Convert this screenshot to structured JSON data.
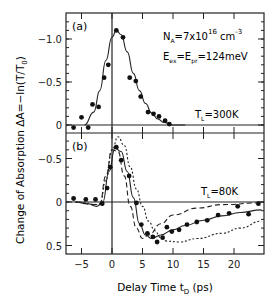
{
  "chart_data": [
    {
      "type": "scatter",
      "panel": "(a)",
      "title": "",
      "annotations": [
        "N_A=7x10^16 cm^-3",
        "E_ex=E_pr=124meV",
        "T_L=300K"
      ],
      "xlabel": "Delay Time t_D (ps)",
      "ylabel": "Change of Absorption ΔA=−ln(T/T_0)",
      "xlim": [
        -8,
        25
      ],
      "ylim": [
        0.1,
        -1.3
      ],
      "yticks": [
        -1.0,
        -0.5,
        0
      ],
      "series": [
        {
          "name": "data",
          "style": "filled-circles",
          "x": [
            -6.3,
            -5.0,
            -3.9,
            -3.2,
            -2.2,
            -1.3,
            -0.6,
            0.7,
            1.8,
            2.9,
            3.9,
            4.7,
            5.9,
            6.8,
            7.7,
            8.7,
            9.4
          ],
          "y": [
            0.03,
            -0.09,
            0.03,
            -0.24,
            -0.21,
            -0.55,
            -0.7,
            -1.1,
            -1.02,
            -0.55,
            -0.51,
            -0.33,
            -0.15,
            -0.13,
            -0.1,
            -0.05,
            -0.01
          ]
        },
        {
          "name": "fit",
          "style": "solid-line",
          "x": [
            -4.5,
            -3,
            -2,
            -1,
            0,
            0.7,
            1.5,
            2.5,
            3.5,
            4.5,
            5.5,
            6.5,
            7.5,
            8.5,
            10,
            12
          ],
          "y": [
            0,
            -0.15,
            -0.4,
            -0.75,
            -1.02,
            -1.1,
            -1.05,
            -0.85,
            -0.6,
            -0.4,
            -0.25,
            -0.14,
            -0.07,
            -0.03,
            0,
            0
          ]
        }
      ]
    },
    {
      "type": "scatter",
      "panel": "(b)",
      "title": "",
      "annotations": [
        "T_L=80K"
      ],
      "xlabel": "Delay Time t_D (ps)",
      "ylabel": "Change of Absorption ΔA=−ln(T/T_0)",
      "xlim": [
        -8,
        25
      ],
      "ylim": [
        -0.85,
        0.55
      ],
      "xticks": [
        -5,
        0,
        5,
        10,
        15,
        20
      ],
      "yticks": [
        -0.5,
        0,
        0.5
      ],
      "series": [
        {
          "name": "data",
          "style": "filled-circles",
          "x": [
            -6.3,
            -4.3,
            -2.7,
            -1.6,
            -0.8,
            -0.3,
            0.7,
            1.5,
            2.8,
            4.0,
            4.8,
            5.8,
            6.7,
            7.4,
            8.3,
            9.0,
            9.8,
            11.0,
            12.3,
            13.9,
            15.6,
            17.4,
            19.2,
            20.6,
            22.4,
            24.0
          ],
          "y": [
            -0.04,
            -0.03,
            -0.03,
            0.02,
            -0.16,
            -0.4,
            -0.63,
            -0.48,
            -0.3,
            0.01,
            0.26,
            0.36,
            0.4,
            0.46,
            0.41,
            0.29,
            0.34,
            0.32,
            0.26,
            0.23,
            0.21,
            0.15,
            0.13,
            0.05,
            0.14,
            0.02,
            0.04
          ]
        },
        {
          "name": "fit-solid",
          "style": "solid-line",
          "x": [
            -6,
            -4,
            -2.5,
            -1.5,
            -0.5,
            0.5,
            1.5,
            2.5,
            3.5,
            4.5,
            5.5,
            6.5,
            8,
            10,
            12,
            15,
            18,
            21,
            24.5
          ],
          "y": [
            0,
            0.02,
            0.05,
            0,
            -0.35,
            -0.62,
            -0.58,
            -0.35,
            -0.05,
            0.25,
            0.38,
            0.42,
            0.38,
            0.32,
            0.27,
            0.21,
            0.16,
            0.12,
            0.09
          ]
        },
        {
          "name": "dashed",
          "style": "dashed-line",
          "x": [
            -6,
            -3,
            -2,
            -1,
            0,
            1,
            2,
            3,
            4,
            5,
            6,
            8,
            10,
            14,
            18,
            24.5
          ],
          "y": [
            0,
            0.03,
            0.02,
            -0.3,
            -0.6,
            -0.58,
            -0.3,
            0.05,
            0.3,
            0.42,
            0.38,
            0.25,
            0.15,
            0.07,
            0.03,
            0.01
          ]
        },
        {
          "name": "dotted",
          "style": "dotted-line",
          "x": [
            -6,
            -2,
            -1,
            0,
            1,
            2,
            3,
            4,
            5,
            6,
            7,
            8,
            9,
            11,
            14,
            18,
            21,
            24.5
          ],
          "y": [
            0,
            0.03,
            -0.25,
            -0.6,
            -0.75,
            -0.65,
            -0.4,
            -0.15,
            0.05,
            0.22,
            0.33,
            0.41,
            0.45,
            0.46,
            0.42,
            0.36,
            0.3,
            0.22
          ]
        }
      ]
    }
  ],
  "labels": {
    "ylabel": "Change of Absorption ΔA=−ln(T/T",
    "ylabel_sub": "0",
    "ylabel_end": ")",
    "xlabel": "Delay Time t",
    "xlabel_sub": "D",
    "xlabel_end": " (ps)",
    "panel_a": "(a)",
    "panel_b": "(b)",
    "na": "N",
    "na_sub": "A",
    "na_val": "=7x10",
    "na_exp": "16",
    "na_unit": " cm",
    "na_unit_exp": "-3",
    "e_ex": "E",
    "e_ex_sub": "ex",
    "e_eq": "=E",
    "e_pr_sub": "pr",
    "e_val": "=124meV",
    "tl": "T",
    "tl_sub": "L",
    "tl_a_val": "=300K",
    "tl_b_val": "=80K",
    "yticks_a": [
      "-1.0",
      "-0.5",
      "0"
    ],
    "yticks_b": [
      "-0.5",
      "0",
      "0.5"
    ],
    "xticks": [
      "-5",
      "0",
      "5",
      "10",
      "15",
      "20"
    ]
  }
}
